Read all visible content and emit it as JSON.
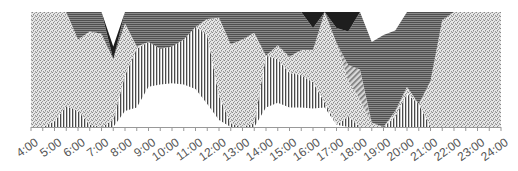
{
  "chart_data": {
    "type": "area",
    "stacked": true,
    "normalized_percent": true,
    "title": "",
    "xlabel": "",
    "ylabel": "",
    "ylim": [
      0,
      100
    ],
    "grid": false,
    "legend": null,
    "x_tick_labels": [
      "4:00",
      "5:00",
      "6:00",
      "7:00",
      "8:00",
      "9:00",
      "10:00",
      "11:00",
      "12:00",
      "13:00",
      "14:00",
      "15:00",
      "16:00",
      "17:00",
      "18:00",
      "19:00",
      "20:00",
      "21:00",
      "22:00",
      "23:00",
      "24:00"
    ],
    "x_hours": [
      4,
      4.5,
      5,
      5.5,
      6,
      6.5,
      7,
      7.5,
      8,
      8.5,
      9,
      9.5,
      10,
      10.5,
      11,
      11.5,
      12,
      12.5,
      13,
      13.5,
      14,
      14.5,
      15,
      15.5,
      16,
      16.5,
      17,
      17.5,
      18,
      18.5,
      19,
      19.5,
      20,
      20.5,
      21,
      21.5,
      22,
      22.5,
      23,
      23.5,
      24
    ],
    "series": [
      {
        "name": "Series 1 (white)",
        "pattern": "none",
        "values": [
          0,
          0,
          0,
          0,
          0,
          0,
          0,
          0,
          14,
          17,
          35,
          37,
          38,
          37,
          33,
          20,
          6,
          0,
          0,
          0,
          17,
          21,
          17,
          17,
          16,
          17,
          2,
          0,
          0,
          0,
          0,
          0,
          0,
          0,
          0,
          0,
          0,
          0,
          0,
          0,
          0
        ]
      },
      {
        "name": "Series 2 (vertical stripes)",
        "pattern": "vertical",
        "values": [
          0,
          0,
          5,
          18,
          14,
          2,
          0,
          6,
          31,
          51,
          39,
          31,
          32,
          39,
          54,
          60,
          21,
          3,
          0,
          3,
          45,
          38,
          30,
          28,
          23,
          4,
          0,
          9,
          0,
          0,
          0,
          9,
          29,
          20,
          0,
          0,
          0,
          0,
          0,
          0,
          0
        ]
      },
      {
        "name": "Series 3 (dotted)",
        "pattern": "dots",
        "values": [
          100,
          100,
          95,
          82,
          62,
          81,
          81,
          53,
          45,
          2,
          0,
          0,
          0,
          0,
          0,
          14,
          68,
          69,
          76,
          79,
          0,
          12,
          14,
          22,
          28,
          79,
          71,
          31,
          24,
          4,
          0,
          5,
          6,
          0,
          40,
          93,
          100,
          100,
          100,
          100,
          100
        ]
      },
      {
        "name": "Series 4 (diagonal stripes)",
        "pattern": "diagonal",
        "values": [
          0,
          0,
          0,
          0,
          0,
          0,
          0,
          0,
          0,
          0,
          0,
          0,
          0,
          0,
          0,
          0,
          0,
          0,
          0,
          0,
          0,
          0,
          0,
          0,
          0,
          0,
          0,
          14,
          26,
          0,
          0,
          0,
          0,
          0,
          0,
          0,
          0,
          0,
          0,
          0,
          0
        ]
      },
      {
        "name": "Series 5 (horizontal stripes)",
        "pattern": "horizontal",
        "values": [
          0,
          0,
          0,
          0,
          24,
          17,
          19,
          0,
          10,
          30,
          26,
          32,
          30,
          24,
          13,
          6,
          5,
          28,
          24,
          18,
          38,
          29,
          39,
          33,
          19,
          0,
          13,
          29,
          50,
          70,
          80,
          70,
          65,
          80,
          60,
          7,
          0,
          0,
          0,
          0,
          0
        ]
      },
      {
        "name": "Series 6 (black)",
        "pattern": "solid",
        "values": [
          0,
          0,
          0,
          0,
          0,
          0,
          0,
          11,
          0,
          0,
          0,
          0,
          0,
          0,
          0,
          0,
          0,
          0,
          0,
          0,
          0,
          0,
          0,
          0,
          14,
          0,
          14,
          17,
          0,
          0,
          0,
          0,
          0,
          0,
          0,
          0,
          0,
          0,
          0,
          0,
          0
        ]
      }
    ]
  },
  "colors": {
    "axis": "#999999",
    "tick_label": "#555555",
    "white_fill": "#ffffff",
    "stripe": "#555555",
    "dots": "#8a8a8a",
    "diag": "#777777",
    "horiz": "#5a5a5a",
    "black": "#1e1e1e"
  }
}
